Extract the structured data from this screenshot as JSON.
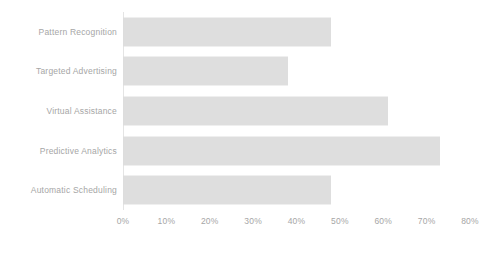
{
  "chart_data": {
    "type": "bar",
    "orientation": "horizontal",
    "title": "",
    "subtitle": "",
    "xlabel": "",
    "ylabel": "",
    "categories": [
      "Pattern Recognition",
      "Targeted Advertising",
      "Virtual Assistance",
      "Predictive Analytics",
      "Automatic Scheduling"
    ],
    "values": [
      48,
      38,
      61,
      73,
      48
    ],
    "value_suffix": "%",
    "xlim": [
      0,
      80
    ],
    "xticks": [
      0,
      10,
      20,
      30,
      40,
      50,
      60,
      70,
      80
    ],
    "xtick_labels": [
      "0%",
      "10%",
      "20%",
      "30%",
      "40%",
      "50%",
      "60%",
      "70%",
      "80%"
    ],
    "grid": false,
    "legend": false,
    "legend_position": "none",
    "bar_color": "#dcdcdc",
    "axis_line_color": "#e4e4e4",
    "label_color": "#a6a6a6"
  }
}
